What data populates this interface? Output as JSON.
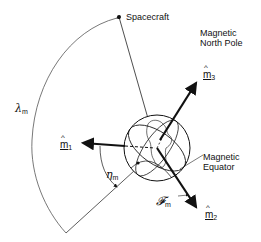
{
  "diagram": {
    "type": "geometry-figure",
    "labels": {
      "spacecraft": "Spacecraft",
      "north_pole_line1": "Magnetic",
      "north_pole_line2": "North Pole",
      "equator_line1": "Magnetic",
      "equator_line2": "Equator",
      "lambda": "λ",
      "lambda_sub": "m",
      "eta": "η",
      "eta_sub": "m",
      "script_f": "𝓕",
      "script_f_sub": "m",
      "m1": "m",
      "m1_sub": "1",
      "m2": "m",
      "m2_sub": "2",
      "m3": "m",
      "m3_sub": "3",
      "hat": "^"
    },
    "colors": {
      "line": "#111111",
      "background": "#ffffff"
    }
  }
}
